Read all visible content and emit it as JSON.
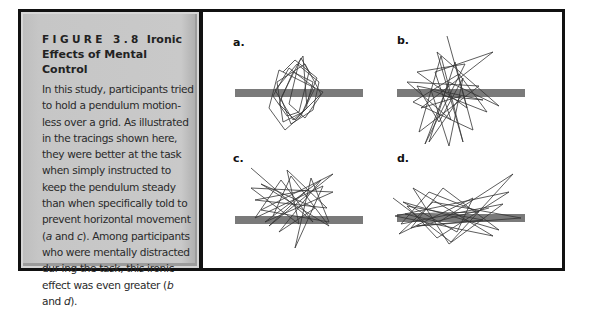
{
  "figure": {
    "number": "FIGURE 3.8",
    "title_line1": "Ironic",
    "title_line2": "Effects of Mental Control",
    "caption": {
      "part1": "In this study, participants tried to hold a pendulum motion-less over a grid. As illustrated in the tracings shown here, they were better at the task when simply instructed to keep the pendulum steady than when specifically told to prevent horizontal movement (",
      "ref_a": "a",
      "part2": " and ",
      "ref_c": "c",
      "part3": "). Among participants who were mentally distracted dur-ing the task, this ironic effect was even greater (",
      "ref_b": "b",
      "part4": " and ",
      "ref_d": "d",
      "part5": ")."
    }
  },
  "panels": [
    {
      "label": "a.",
      "condition": "steady instruction, not distracted"
    },
    {
      "label": "b.",
      "condition": "steady instruction, distracted"
    },
    {
      "label": "c.",
      "condition": "prevent horizontal movement, not distracted"
    },
    {
      "label": "d.",
      "condition": "prevent horizontal movement, distracted"
    }
  ],
  "colors": {
    "frame": "#111111",
    "caption_bg": "#c6c6c6",
    "grid_bar": "#7a7a7a",
    "tracing": "#333333"
  }
}
